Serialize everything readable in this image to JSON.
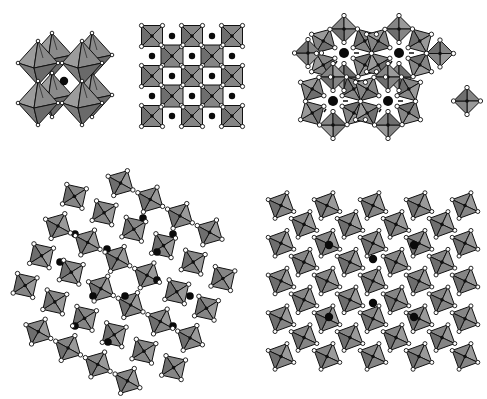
{
  "figure": {
    "colors": {
      "background": "#ffffff",
      "octa_face_light": "#9a9a9a",
      "octa_face_mid": "#858585",
      "octa_face_dark": "#6e6e6e",
      "edge": "#111111",
      "anion": "#ffffff",
      "b_cation": "#111111",
      "a_cation": "#0a0a0a"
    },
    "panels": [
      {
        "id": "perovskite-3d",
        "label": "",
        "center": [
          62,
          84
        ]
      },
      {
        "id": "perovskite-projection",
        "label": "",
        "center": [
          195,
          78
        ]
      },
      {
        "id": "hexagonal-bronze",
        "label": "",
        "center": [
          378,
          77
        ]
      },
      {
        "id": "complex-bronze",
        "label": "",
        "center": [
          124,
          284
        ]
      },
      {
        "id": "tetragonal-bronze",
        "label": "",
        "center": [
          373,
          281
        ]
      }
    ]
  }
}
